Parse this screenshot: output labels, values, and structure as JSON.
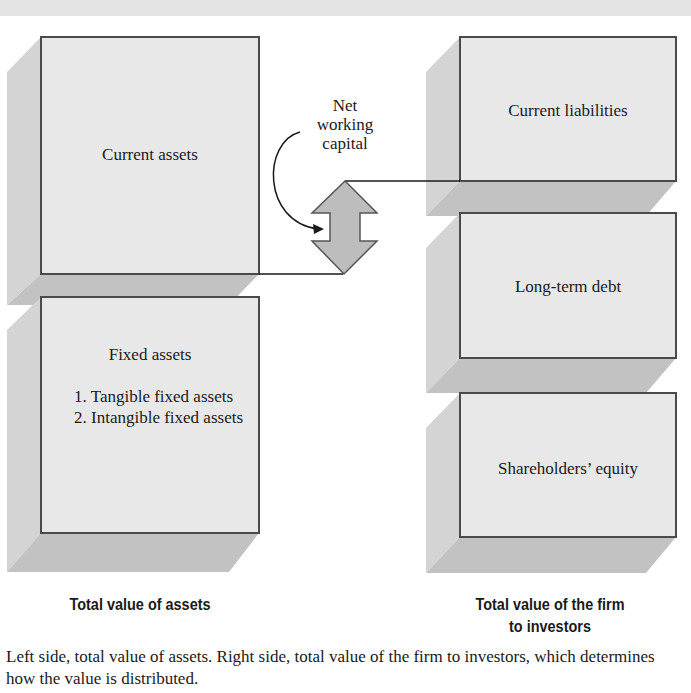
{
  "diagram": {
    "left_side": {
      "boxes": [
        {
          "id": "current-assets",
          "label": "Current assets"
        },
        {
          "id": "fixed-assets",
          "label": "Fixed assets",
          "items": [
            "1. Tangible fixed assets",
            "2. Intangible fixed assets"
          ]
        }
      ],
      "total_label": "Total value of assets"
    },
    "right_side": {
      "boxes": [
        {
          "id": "current-liabilities",
          "label": "Current liabilities"
        },
        {
          "id": "long-term-debt",
          "label": "Long-term debt"
        },
        {
          "id": "shareholders-equity",
          "label": "Shareholders’ equity"
        }
      ],
      "total_label_line1": "Total value of the firm",
      "total_label_line2": "to investors"
    },
    "connector": {
      "label_line1": "Net",
      "label_line2": "working",
      "label_line3": "capital"
    },
    "colors": {
      "box_fill": "#e6e6e6",
      "box_border": "#4a4a4a",
      "shadow_side": "#c9c9c9",
      "shadow_bottom": "#bdbdbd",
      "arrow_fill": "#bcbcbc"
    }
  },
  "caption": "Left side, total value of assets. Right side, total value of the firm to investors, which determines how the value is distributed."
}
